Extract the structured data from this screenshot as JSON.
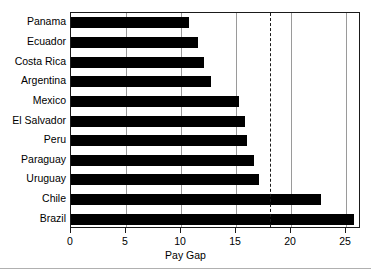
{
  "chart_data": {
    "type": "bar",
    "orientation": "horizontal",
    "title": "",
    "xlabel": "Pay Gap",
    "ylabel": "",
    "categories": [
      "Panama",
      "Ecuador",
      "Costa Rica",
      "Argentina",
      "Mexico",
      "El Salvador",
      "Peru",
      "Paraguay",
      "Uruguay",
      "Chile",
      "Brazil"
    ],
    "values": [
      10.7,
      11.6,
      12.1,
      12.7,
      15.3,
      15.8,
      16.0,
      16.7,
      17.1,
      22.8,
      25.8
    ],
    "xlim": [
      0,
      26.4
    ],
    "xticks": [
      0,
      5,
      10,
      15,
      20,
      25
    ],
    "xticklabels": [
      "0",
      "5",
      "10",
      "15",
      "20",
      "25"
    ],
    "grid": "vertical",
    "gridlines": [
      5,
      10,
      15,
      20,
      25
    ],
    "reference_line": {
      "value": 18.1,
      "style": "dashed",
      "orientation": "vertical"
    },
    "legend": null,
    "bar_color": "#000000",
    "frame_color": "#1a1a1a",
    "grid_color": "#9a9a9a",
    "background": "#ffffff"
  }
}
